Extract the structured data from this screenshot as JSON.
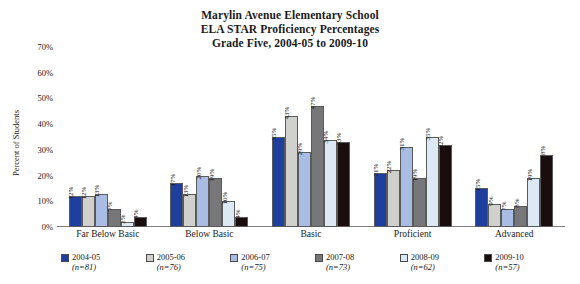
{
  "chart_data": {
    "type": "bar",
    "title": "Marylin Avenue Elementary School ELA STAR Proficiency Percentages Grade Five, 2004-05 to 2009-10",
    "title_lines": [
      "Marylin Avenue Elementary School",
      "ELA STAR Proficiency Percentages",
      "Grade Five, 2004-05 to 2009-10"
    ],
    "xlabel": "",
    "ylabel": "Percent of Students",
    "ylim": [
      0,
      70
    ],
    "ytick_labels": [
      "0%",
      "10%",
      "20%",
      "30%",
      "40%",
      "50%",
      "60%",
      "70%"
    ],
    "ytick_values": [
      0,
      10,
      20,
      30,
      40,
      50,
      60,
      70
    ],
    "grid": false,
    "legend_position": "bottom",
    "categories": [
      "Far Below Basic",
      "Below Basic",
      "Basic",
      "Proficient",
      "Advanced"
    ],
    "series": [
      {
        "name": "2004-05",
        "n": "(n=81)",
        "color": "#1f3f9e",
        "values": [
          12,
          17,
          35,
          21,
          15
        ],
        "value_labels": [
          "12%",
          "17%",
          "35%",
          "21%",
          "15%"
        ]
      },
      {
        "name": "2005-06",
        "n": "(n=76)",
        "color": "#d0d0cc",
        "values": [
          12,
          13,
          43,
          22,
          9
        ],
        "value_labels": [
          "12%",
          "13%",
          "43%",
          "22%",
          "9%"
        ]
      },
      {
        "name": "2006-07",
        "n": "(n=75)",
        "color": "#a8bce4",
        "values": [
          13,
          20,
          29,
          31,
          7
        ],
        "value_labels": [
          "13%",
          "20%",
          "29%",
          "31%",
          "7%"
        ]
      },
      {
        "name": "2007-08",
        "n": "(n=73)",
        "color": "#77777a",
        "values": [
          7,
          19,
          47,
          19,
          8
        ],
        "value_labels": [
          "7%",
          "19%",
          "47%",
          "19%",
          "8%"
        ]
      },
      {
        "name": "2008-09",
        "n": "(n=62)",
        "color": "#dce8f4",
        "values": [
          2,
          10,
          34,
          35,
          19
        ],
        "value_labels": [
          "2%",
          "10%",
          "34%",
          "35%",
          "19%"
        ]
      },
      {
        "name": "2009-10",
        "n": "(n=57)",
        "color": "#1a0d0d",
        "values": [
          4,
          4,
          33,
          32,
          28
        ],
        "value_labels": [
          "4%",
          "4%",
          "33%",
          "32%",
          "28%"
        ]
      }
    ]
  }
}
